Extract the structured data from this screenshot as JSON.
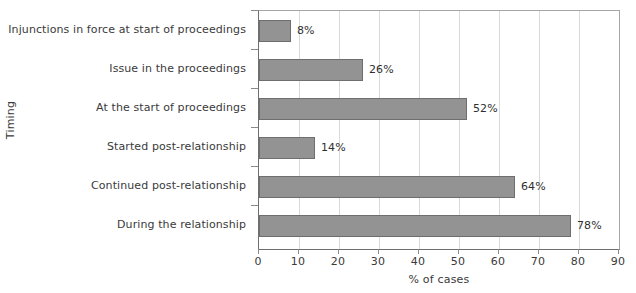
{
  "chart_data": {
    "type": "bar",
    "orientation": "horizontal",
    "title": "",
    "xlabel": "% of cases",
    "ylabel": "Timing",
    "xlim": [
      0,
      90
    ],
    "xticks": [
      0,
      10,
      20,
      30,
      40,
      50,
      60,
      70,
      80,
      90
    ],
    "grid": true,
    "legend": false,
    "categories": [
      "Injunctions in force at start of proceedings",
      "Issue in the proceedings",
      "At the start of proceedings",
      "Started post-relationship",
      "Continued post-relationship",
      "During the relationship"
    ],
    "values": [
      8,
      26,
      52,
      14,
      64,
      78
    ],
    "data_labels": [
      "8%",
      "26%",
      "52%",
      "14%",
      "64%",
      "78%"
    ],
    "bar_color": "#939393",
    "bar_border_color": "#6e6e6e",
    "gridline_color": "#d9d9d9",
    "axis_color": "#6f6f6f",
    "text_color": "#3a3a3a"
  }
}
